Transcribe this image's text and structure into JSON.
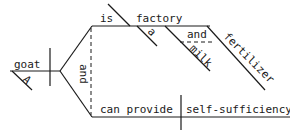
{
  "diagram": {
    "type": "sentence-diagram",
    "subject": {
      "word": "goat",
      "modifiers": [
        "A"
      ]
    },
    "conjunction_predicates": "and",
    "predicate_1": {
      "verb": "is",
      "predicate_noun": "factory",
      "noun_modifiers": [
        "a"
      ],
      "compound_modifier": {
        "conjunction": "and",
        "words": [
          "milk",
          "fertilizer"
        ]
      }
    },
    "predicate_2": {
      "verb": "can provide",
      "direct_object": "self-sufficiency"
    }
  }
}
